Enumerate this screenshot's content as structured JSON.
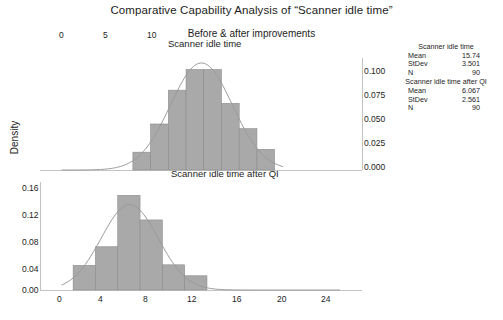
{
  "title": "Comparative Capability Analysis of “Scanner idle time”",
  "subtitle": "Before & after improvements",
  "axis_label_y": "Density",
  "panels": [
    {
      "title": "Scanner idle time",
      "x_ticks": [
        "0",
        "5",
        "10"
      ],
      "y_ticks": [
        "0.100",
        "0.075",
        "0.050",
        "0.025",
        "0.000"
      ]
    },
    {
      "title": "Scanner idle time after QI",
      "x_ticks": [
        "0",
        "4",
        "8",
        "12",
        "16",
        "20",
        "24"
      ],
      "y_ticks": [
        "0.16",
        "0.12",
        "0.08",
        "0.04",
        "0.00"
      ]
    }
  ],
  "stats": [
    {
      "heading": "Scanner idle time",
      "rows": [
        {
          "label": "Mean",
          "value": "15.74"
        },
        {
          "label": "StDev",
          "value": "3.501"
        },
        {
          "label": "N",
          "value": "90"
        }
      ]
    },
    {
      "heading": "Scanner idle time after QI",
      "rows": [
        {
          "label": "Mean",
          "value": "6.067"
        },
        {
          "label": "StDev",
          "value": "2.561"
        },
        {
          "label": "N",
          "value": "90"
        }
      ]
    }
  ],
  "colors": {
    "bar_fill": "#a9a9a9",
    "bar_edge": "#8c8c8c",
    "curve": "#9a9a9a",
    "axis": "#b4b4b4",
    "text": "#1c1c1c"
  },
  "chart_data": {
    "type": "bar",
    "title": "Comparative Capability Analysis of “Scanner idle time”",
    "subtitle": "Before & after improvements",
    "xlabel": "",
    "ylabel": "Density",
    "grid": false,
    "legend": "none",
    "panels": [
      {
        "name": "Scanner idle time",
        "mean": 15.74,
        "stdev": 3.501,
        "n": 90,
        "xlim": [
          0,
          25
        ],
        "ylim": [
          0.0,
          0.115
        ],
        "ytick_values": [
          0.0,
          0.025,
          0.05,
          0.075,
          0.1
        ],
        "xtick_values": [
          0,
          5,
          10
        ],
        "bin_width": 2,
        "bin_edges": [
          8,
          10,
          12,
          14,
          16,
          18,
          20,
          22,
          24
        ],
        "densities": [
          0.019,
          0.049,
          0.085,
          0.107,
          0.107,
          0.071,
          0.044,
          0.022
        ],
        "overlay_curve": {
          "type": "normal",
          "mean": 15.74,
          "stdev": 3.501
        }
      },
      {
        "name": "Scanner idle time after QI",
        "mean": 6.067,
        "stdev": 2.561,
        "n": 90,
        "xlim": [
          0,
          25
        ],
        "ylim": [
          0.0,
          0.19
        ],
        "ytick_values": [
          0.0,
          0.04,
          0.08,
          0.12,
          0.16
        ],
        "xtick_values": [
          0,
          4,
          8,
          12,
          16,
          20,
          24
        ],
        "bin_width": 2,
        "bin_edges": [
          1,
          3,
          5,
          7,
          9,
          11,
          13
        ],
        "densities": [
          0.045,
          0.079,
          0.173,
          0.128,
          0.046,
          0.026
        ],
        "overlay_curve": {
          "type": "normal",
          "mean": 6.067,
          "stdev": 2.561
        }
      }
    ]
  }
}
